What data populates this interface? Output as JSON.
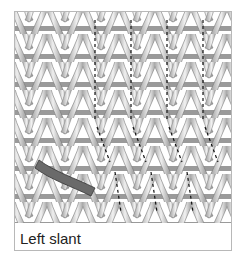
{
  "figure": {
    "caption": "Left slant",
    "colors": {
      "yarn_light": "#e6e6e6",
      "yarn_dark": "#8a8a8a",
      "slant_strand": "#555555",
      "dashed_line": "#111111",
      "frame_border": "#b8b8b8"
    },
    "stitch_grid": {
      "columns": 12,
      "rows": 8
    },
    "dashed_columns": [
      5,
      7,
      9,
      11
    ]
  }
}
